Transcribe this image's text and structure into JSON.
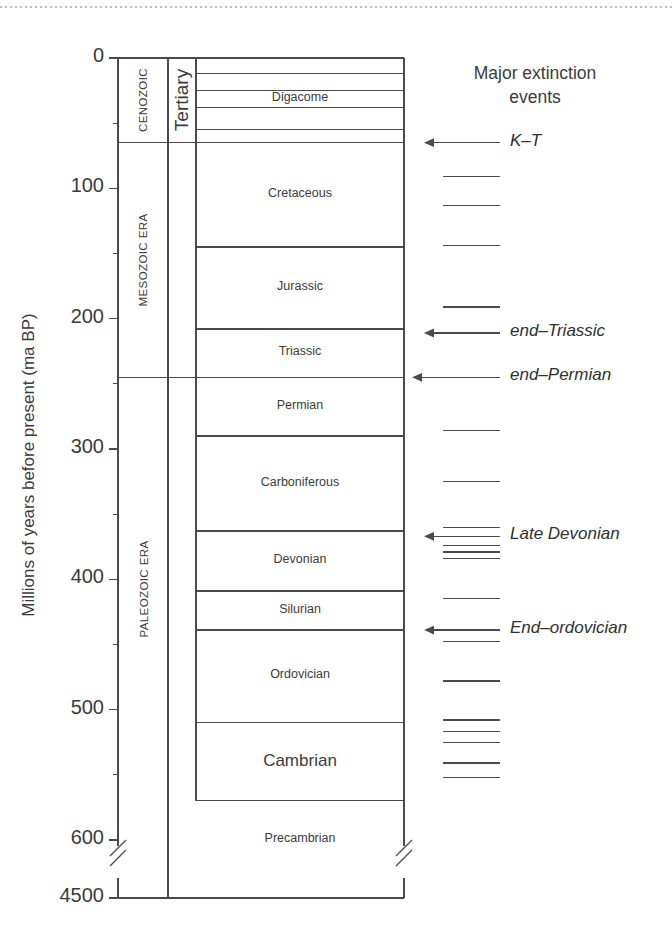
{
  "figure": {
    "axis_title": "Millions of years before present (ma BP)",
    "extinction_header_line1": "Major extinction",
    "extinction_header_line2": "events",
    "line_color": "#4a4a4a",
    "text_color": "#3b3b3b"
  },
  "chart_data": {
    "type": "table",
    "ylabel": "Millions of years before present (ma BP)",
    "ylim": [
      0,
      4500
    ],
    "axis_break": true,
    "axis_break_between": [
      620,
      4500
    ],
    "grid": false,
    "major_ticks": [
      "0",
      "100",
      "200",
      "300",
      "400",
      "500",
      "600",
      "4500"
    ],
    "minor_ticks": [
      "50",
      "150",
      "250",
      "350",
      "450",
      "550"
    ],
    "eras": [
      {
        "label": "CENOZOIC",
        "start": 0,
        "end": 65
      },
      {
        "label": "MESOZOIC ERA",
        "start": 65,
        "end": 245
      },
      {
        "label": "PALEOZOIC ERA",
        "start": 245,
        "end": 570
      }
    ],
    "sub_column": [
      {
        "label": "Tertiary",
        "start": 0,
        "end": 65
      }
    ],
    "epoch_dividers": [
      12,
      25,
      38,
      55
    ],
    "epoch_label": "Digacome",
    "periods": [
      {
        "label": "Cretaceous",
        "start": 65,
        "end": 145
      },
      {
        "label": "Jurassic",
        "start": 145,
        "end": 208
      },
      {
        "label": "Triassic",
        "start": 208,
        "end": 245
      },
      {
        "label": "Permian",
        "start": 245,
        "end": 290
      },
      {
        "label": "Carboniferous",
        "start": 290,
        "end": 363
      },
      {
        "label": "Devonian",
        "start": 363,
        "end": 409
      },
      {
        "label": "Silurian",
        "start": 409,
        "end": 439
      },
      {
        "label": "Ordovician",
        "start": 439,
        "end": 510
      },
      {
        "label": "Cambrian",
        "start": 510,
        "end": 570
      },
      {
        "label": "Precambrian",
        "start": 570,
        "end": 4500
      }
    ],
    "extinction_events": [
      {
        "label": "K–T",
        "age": 65,
        "major": true
      },
      {
        "label": "",
        "age": 91,
        "major": false
      },
      {
        "label": "",
        "age": 113,
        "major": false
      },
      {
        "label": "",
        "age": 144,
        "major": false
      },
      {
        "label": "",
        "age": 191,
        "major": false
      },
      {
        "label": "end–Triassic",
        "age": 211,
        "major": true
      },
      {
        "label": "end–Permian",
        "age": 245,
        "major": true
      },
      {
        "label": "",
        "age": 286,
        "major": false
      },
      {
        "label": "",
        "age": 325,
        "major": false
      },
      {
        "label": "",
        "age": 360,
        "major": false
      },
      {
        "label": "Late Devonian",
        "age": 367,
        "major": true
      },
      {
        "label": "",
        "age": 374,
        "major": false
      },
      {
        "label": "",
        "age": 379,
        "major": false
      },
      {
        "label": "",
        "age": 384,
        "major": false
      },
      {
        "label": "",
        "age": 415,
        "major": false
      },
      {
        "label": "End–ordovician",
        "age": 439,
        "major": true
      },
      {
        "label": "",
        "age": 448,
        "major": false
      },
      {
        "label": "",
        "age": 478,
        "major": false
      },
      {
        "label": "",
        "age": 508,
        "major": false
      },
      {
        "label": "",
        "age": 517,
        "major": false
      },
      {
        "label": "",
        "age": 525,
        "major": false
      },
      {
        "label": "",
        "age": 541,
        "major": false
      },
      {
        "label": "",
        "age": 552,
        "major": false
      }
    ]
  }
}
